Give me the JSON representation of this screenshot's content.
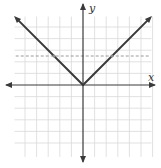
{
  "chart_data": {
    "type": "line",
    "title": "",
    "xlabel": "x",
    "ylabel": "y",
    "xlim": [
      -6,
      6
    ],
    "ylim": [
      -6,
      6
    ],
    "grid": true,
    "legend": null,
    "series": [
      {
        "name": "y = |x|",
        "style": "solid",
        "color": "#3a3a3a",
        "x": [
          -5.7,
          0,
          5.7
        ],
        "y": [
          5.7,
          0,
          5.7
        ]
      },
      {
        "name": "horizontal reference",
        "style": "dashed",
        "color": "#9a9a9a",
        "x": [
          -5.8,
          5.8
        ],
        "y": [
          2.5,
          2.5
        ]
      }
    ],
    "annotations": [
      {
        "type": "intersection",
        "x": -2.5,
        "y": 2.5
      },
      {
        "type": "intersection",
        "x": 2.5,
        "y": 2.5
      }
    ]
  },
  "axes": {
    "x_label": "x",
    "y_label": "y"
  },
  "colors": {
    "grid": "#d9d9d9",
    "axis": "#3a3a3a",
    "curve": "#3a3a3a",
    "dashed": "#9a9a9a"
  }
}
